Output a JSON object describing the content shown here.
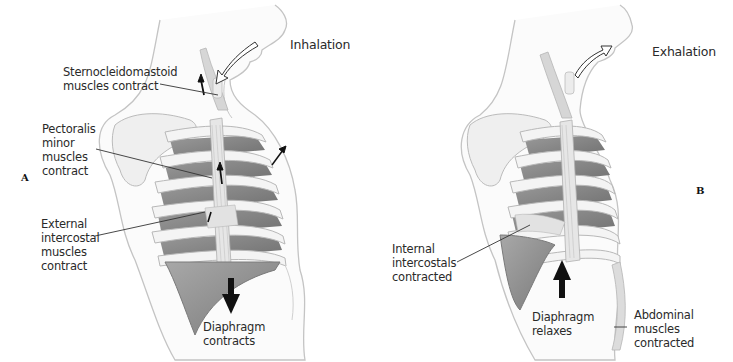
{
  "figure": {
    "panels": [
      {
        "id": "A",
        "letter": "A",
        "title": "Inhalation",
        "labels": {
          "sternocleidomastoid": "Sternocleidomastoid\nmuscles contract",
          "pectoralis": "Pectoralis\nminor\nmuscles\ncontract",
          "external_intercostal": "External\nintercostal\nmuscles\ncontract",
          "diaphragm": "Diaphragm\ncontracts"
        },
        "arrows": {
          "airflow": "into-mouth",
          "diaphragm": "down",
          "ribcage": "up-outward"
        }
      },
      {
        "id": "B",
        "letter": "B",
        "title": "Exhalation",
        "labels": {
          "internal_intercostals": "Internal\nintercostals\ncontracted",
          "diaphragm": "Diaphragm\nrelaxes",
          "abdominal": "Abdominal\nmuscles\ncontracted"
        },
        "arrows": {
          "airflow": "out-of-mouth",
          "diaphragm": "up"
        }
      }
    ],
    "colors": {
      "outline": "#bdbdbd",
      "bone": "#f2f2f2",
      "muscle": "#8a8a8a",
      "muscle_dark": "#6e6e6e",
      "leader_line": "#333333",
      "arrow": "#111111"
    }
  }
}
